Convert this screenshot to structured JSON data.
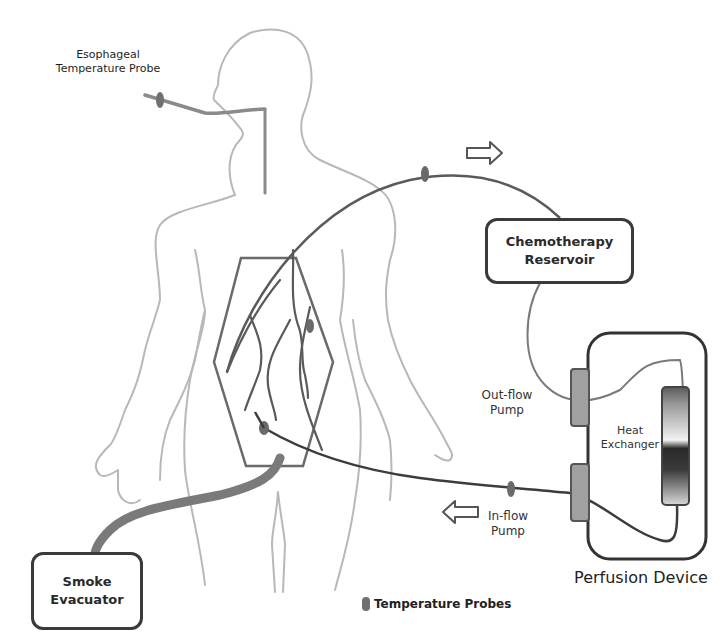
{
  "diagram": {
    "type": "hyperthermic intraperitoneal chemotherapy perfusion circuit",
    "labels": {
      "esophageal_probe_line1": "Esophageal",
      "esophageal_probe_line2": "Temperature Probe",
      "chemo_reservoir_line1": "Chemotherapy",
      "chemo_reservoir_line2": "Reservoir",
      "outflow_pump_line1": "Out-flow",
      "outflow_pump_line2": "Pump",
      "inflow_pump_line1": "In-flow",
      "inflow_pump_line2": "Pump",
      "heat_exchanger_line1": "Heat",
      "heat_exchanger_line2": "Exchanger",
      "perfusion_device": "Perfusion Device",
      "smoke_evacuator_line1": "Smoke",
      "smoke_evacuator_line2": "Evacuator"
    },
    "legend": {
      "probe_symbol": "temperature-probe-marker",
      "label": "Temperature Probes"
    },
    "arrows": {
      "outflow_direction": "right",
      "inflow_direction": "left"
    },
    "colors": {
      "body_outline": "#b8b8b8",
      "tubing": "#5a5a5a",
      "tubing_dark": "#3c3c3c",
      "box_border": "#3a3a3a",
      "pump_fill": "#9a9a9a",
      "smoke_tube": "#6e6e6e",
      "probe": "#6a6a6a"
    }
  }
}
